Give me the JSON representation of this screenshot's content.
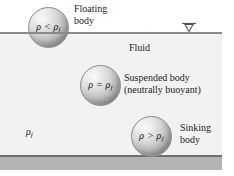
{
  "figure": {
    "regions": {
      "air_label": "",
      "fluid_label": "Fluid",
      "fluid_density_label": "ρ",
      "fluid_density_sub": "f",
      "bed_label": ""
    },
    "water_level_marker": {
      "name": "free-surface-level-symbol",
      "glyph": "▽"
    },
    "bodies": [
      {
        "id": "floating",
        "condition_symbol": "ρ < ρ",
        "condition_sub": "f",
        "caption_line1": "Floating",
        "caption_line2": "body"
      },
      {
        "id": "suspended",
        "condition_symbol": "ρ = ρ",
        "condition_sub": "f",
        "caption_line1": "Suspended body",
        "caption_line2": "(neutrally buoyant)"
      },
      {
        "id": "sinking",
        "condition_symbol": "ρ > ρ",
        "condition_sub": "f",
        "caption_line1": "Sinking",
        "caption_line2": "body"
      }
    ],
    "colors": {
      "fluid_fill": "#f2f2f2",
      "surface_line": "#8a8a8a",
      "bed_band": "#b4b4b4",
      "bed_line": "#6e6e6e",
      "sphere_mid": "#bdbdbd",
      "text": "#1a1a1a"
    }
  }
}
